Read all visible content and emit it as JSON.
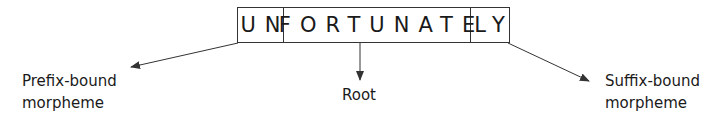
{
  "word": {
    "prefix": "UN",
    "root": "FORTUNATE",
    "suffix": "LY"
  },
  "labels": {
    "prefix_line1": "Prefix-bound",
    "prefix_line2": "morpheme",
    "root": "Root",
    "suffix_line1": "Suffix-bound",
    "suffix_line2": "morpheme"
  },
  "colors": {
    "line": "#333333",
    "text": "#1a1a1a"
  }
}
